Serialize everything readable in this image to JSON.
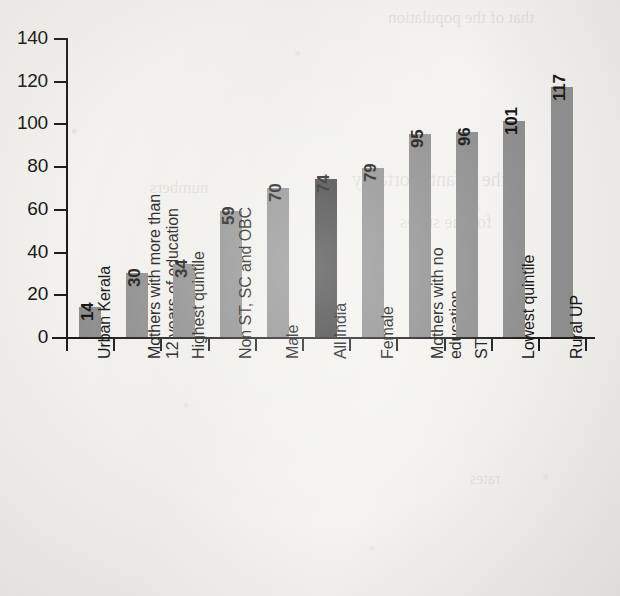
{
  "chart_data": {
    "type": "bar",
    "title": "",
    "xlabel": "",
    "ylabel": "",
    "ylim": [
      0,
      140
    ],
    "yticks": [
      0,
      20,
      40,
      60,
      80,
      100,
      120,
      140
    ],
    "grid": false,
    "legend": null,
    "categories": [
      "Urban Kerala",
      "Mothers with more than 12 years of education",
      "Highest quintile",
      "Non ST, SC and OBC",
      "Male",
      "All India",
      "Female",
      "Mothers with no education",
      "ST",
      "Lowest quintile",
      "Rural UP"
    ],
    "category_lines": [
      [
        "Urban Kerala"
      ],
      [
        "Mothers with more than",
        "12 years of education"
      ],
      [
        "Highest quintile"
      ],
      [
        "Non ST, SC and OBC"
      ],
      [
        "Male"
      ],
      [
        "All India"
      ],
      [
        "Female"
      ],
      [
        "Mothers with no",
        "education"
      ],
      [
        "ST"
      ],
      [
        "Lowest quintile"
      ],
      [
        "Rural UP"
      ]
    ],
    "values": [
      14,
      30,
      34,
      59,
      70,
      74,
      79,
      95,
      96,
      101,
      117
    ],
    "highlight_index": 5,
    "colors": {
      "bar": "#8d8d8d",
      "bar_highlight": "#3b3b3b",
      "axis": "#1c1c1c",
      "text": "#141414",
      "background": "#f1f0ec"
    }
  },
  "bleed_text": {
    "line1": "that of the population",
    "line2": "the infant mortality",
    "line3": "for the states",
    "line4": "numbers",
    "line5": "rates"
  }
}
